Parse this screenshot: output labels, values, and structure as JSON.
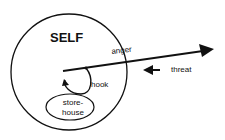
{
  "diagram": {
    "labels": {
      "self": "SELF",
      "anger": "anger",
      "threat": "threat",
      "hook": "hook",
      "storehouse_line1": "store-",
      "storehouse_line2": "house"
    },
    "colors": {
      "stroke": "#111111",
      "background": "#ffffff"
    }
  }
}
